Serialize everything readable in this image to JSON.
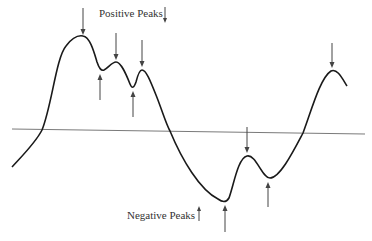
{
  "diagram": {
    "type": "signal-peaks",
    "labels": {
      "positive": "Positive Peaks",
      "negative": "Negative Peaks"
    },
    "legend_icons": {
      "positive": "down-arrow-icon",
      "negative": "up-arrow-icon"
    },
    "colors": {
      "curve": "#1a1a1a",
      "baseline": "#7a7a7a",
      "arrows": "#444444",
      "text": "#333333",
      "background": "#ffffff"
    },
    "curve_points": [
      [
        12,
        167
      ],
      [
        42,
        130
      ],
      [
        83,
        36
      ],
      [
        102,
        70
      ],
      [
        116,
        62
      ],
      [
        133,
        88
      ],
      [
        141,
        70
      ],
      [
        170,
        131
      ],
      [
        225,
        202
      ],
      [
        247,
        156
      ],
      [
        269,
        178
      ],
      [
        303,
        133
      ],
      [
        331,
        71
      ],
      [
        347,
        86
      ]
    ],
    "positive_peaks": [
      {
        "x": 83,
        "y": 36
      },
      {
        "x": 116,
        "y": 62
      },
      {
        "x": 141,
        "y": 70
      },
      {
        "x": 247,
        "y": 156
      },
      {
        "x": 331,
        "y": 71
      }
    ],
    "negative_peaks": [
      {
        "x": 101,
        "y": 72
      },
      {
        "x": 133,
        "y": 89
      },
      {
        "x": 225,
        "y": 203
      },
      {
        "x": 268,
        "y": 180
      }
    ]
  }
}
